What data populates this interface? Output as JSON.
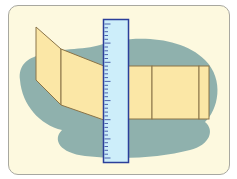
{
  "illustration": {
    "subject": "ruler measuring folded paper strip",
    "colors": {
      "background": "#fdf9df",
      "frame_border": "#a8a8a0",
      "blob": "#8fb1ad",
      "paper_fill": "#fbe7a6",
      "paper_stroke": "#8a7448",
      "ruler_fill": "#cdeefa",
      "ruler_stroke": "#2b3f9a"
    },
    "ruler": {
      "tick_count": 36
    }
  }
}
